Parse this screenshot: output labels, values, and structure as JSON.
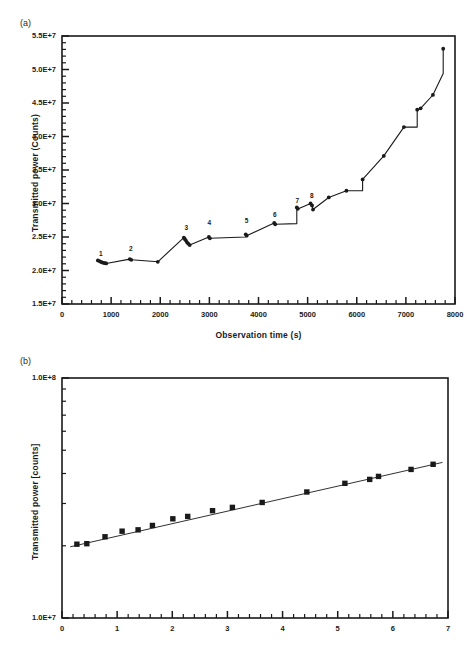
{
  "figure": {
    "panel_a_label": "(a)",
    "panel_b_label": "(b)"
  },
  "chart_data": [
    {
      "id": "panel-a",
      "type": "line",
      "title": "",
      "xlabel": "Observation time (s)",
      "ylabel": "Transmitted power (Counts)",
      "xlim": [
        0,
        8000
      ],
      "ylim": [
        15000000,
        55000000
      ],
      "grid": false,
      "legend": "none",
      "xticks": [
        0,
        1000,
        2000,
        3000,
        4000,
        5000,
        6000,
        7000,
        8000
      ],
      "xtick_labels": [
        "0",
        "1000",
        "2000",
        "3000",
        "4000",
        "5000",
        "6000",
        "7000",
        "8000"
      ],
      "xminor_per_interval": 5,
      "yticks": [
        15000000,
        20000000,
        25000000,
        30000000,
        35000000,
        40000000,
        45000000,
        50000000,
        55000000
      ],
      "ytick_labels": [
        "1.5E+7",
        "2.0E+7",
        "2.5E+7",
        "3.0E+7",
        "3.5E+7",
        "4.0E+7",
        "4.5E+7",
        "5.0E+7",
        "5.5E+7"
      ],
      "yminor_per_interval": 5,
      "marker": "filled-circle",
      "x": [
        730,
        760,
        790,
        815,
        845,
        875,
        900,
        1380,
        1410,
        1950,
        2480,
        2500,
        2520,
        2545,
        2570,
        2600,
        2990,
        3010,
        3740,
        3760,
        4320,
        4340,
        4780,
        4800,
        5060,
        5090,
        5110,
        5430,
        5790,
        6120,
        6550,
        6960,
        7230,
        7300,
        7550,
        7760
      ],
      "y": [
        21500000,
        21400000,
        21300000,
        21200000,
        21150000,
        21100000,
        21050000,
        21700000,
        21600000,
        21300000,
        24900000,
        24700000,
        24500000,
        24200000,
        24000000,
        23800000,
        25000000,
        24800000,
        25400000,
        25200000,
        27100000,
        26900000,
        29400000,
        29200000,
        30000000,
        29700000,
        29100000,
        30900000,
        31900000,
        33600000,
        37100000,
        41400000,
        44000000,
        44200000,
        46200000,
        53100000
      ],
      "step_segments": [
        {
          "from_x": 1950,
          "to_x": 2480,
          "note": "rise"
        },
        {
          "from_x": 3010,
          "to_x": 3740,
          "y": 25000000,
          "note": "plateau"
        },
        {
          "from_x": 4340,
          "to_x": 4780,
          "y": 27000000,
          "note": "plateau-then-jump"
        },
        {
          "from_x": 5790,
          "to_x": 6120,
          "y": 31900000,
          "note": "plateau"
        },
        {
          "from_x": 6960,
          "to_x": 7230,
          "y": 41400000,
          "note": "plateau"
        },
        {
          "from_x": 7300,
          "to_x": 7550,
          "y": 46200000,
          "note": "plateau"
        },
        {
          "from_x": 7550,
          "to_x": 7760,
          "y": 49400000,
          "note": "plateau"
        }
      ],
      "annotations": [
        {
          "text": "1",
          "x": 790,
          "y": 22300000
        },
        {
          "text": "2",
          "x": 1400,
          "y": 23100000
        },
        {
          "text": "3",
          "x": 2530,
          "y": 26200000
        },
        {
          "text": "4",
          "x": 3000,
          "y": 26900000
        },
        {
          "text": "5",
          "x": 3755,
          "y": 27200000
        },
        {
          "text": "6",
          "x": 4330,
          "y": 28200000
        },
        {
          "text": "7",
          "x": 4790,
          "y": 30200000
        },
        {
          "text": "8",
          "x": 5085,
          "y": 31000000
        }
      ]
    },
    {
      "id": "panel-b",
      "type": "scatter",
      "title": "",
      "xlabel": "",
      "ylabel": "Transmitted power [counts]",
      "yscale": "log",
      "xlim": [
        0,
        7
      ],
      "ylim": [
        10000000,
        100000000
      ],
      "grid": false,
      "legend": "none",
      "xticks": [
        0,
        1,
        2,
        3,
        4,
        5,
        6,
        7
      ],
      "xtick_labels": [
        "0",
        "1",
        "2",
        "3",
        "4",
        "5",
        "6",
        "7"
      ],
      "xminor_per_interval": 5,
      "ytick_labels": [
        "1.0E+7",
        "1.0E+8"
      ],
      "marker": "filled-square",
      "x": [
        0.27,
        0.45,
        0.78,
        1.09,
        1.38,
        1.64,
        2.01,
        2.28,
        2.73,
        3.09,
        3.63,
        4.44,
        5.13,
        5.58,
        5.74,
        6.33,
        6.73
      ],
      "y": [
        20300000,
        20400000,
        21800000,
        23000000,
        23300000,
        24300000,
        25900000,
        26500000,
        28000000,
        28900000,
        30300000,
        33500000,
        36400000,
        37800000,
        38900000,
        41600000,
        43700000
      ],
      "fit_line": {
        "type": "exponential",
        "x": [
          0.15,
          6.9
        ],
        "y": [
          19800000,
          44500000
        ]
      }
    }
  ]
}
